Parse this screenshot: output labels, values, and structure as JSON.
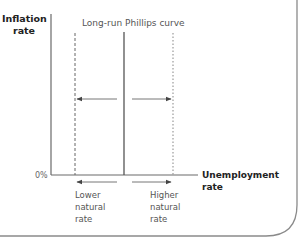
{
  "diagram": {
    "y_axis_label": [
      "Inflation",
      "rate"
    ],
    "x_axis_label": "Unemployment rate",
    "origin_label": "0%",
    "curve_label": "Long-run Phillips curve",
    "left_shift_label": [
      "Lower",
      "natural",
      "rate"
    ],
    "right_shift_label": [
      "Higher",
      "natural",
      "rate"
    ],
    "colors": {
      "axis": "#6a6a6a",
      "curve": "#555555",
      "dashed": "#666666",
      "dotted": "#9a9a9a",
      "arrow": "#555555",
      "border": "#7a7a7a"
    }
  }
}
